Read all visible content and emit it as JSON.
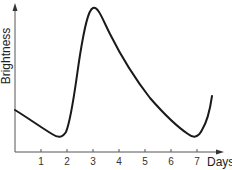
{
  "chart_data": {
    "type": "line",
    "title": "",
    "xlabel": "Days",
    "ylabel": "Brightness",
    "x_ticks": [
      "1",
      "2",
      "3",
      "4",
      "5",
      "6",
      "7"
    ],
    "xlim": [
      0,
      7.6
    ],
    "y_ticks": [],
    "grid": false,
    "legend": null,
    "series": [
      {
        "name": "Brightness",
        "x": [
          0.0,
          0.6,
          1.2,
          1.55,
          1.9,
          2.3,
          2.7,
          2.95,
          3.2,
          3.6,
          4.2,
          5.0,
          5.7,
          6.3,
          6.75,
          7.0,
          7.25
        ],
        "y": [
          0.22,
          0.15,
          0.09,
          0.08,
          0.22,
          0.7,
          0.96,
          0.98,
          0.9,
          0.72,
          0.53,
          0.33,
          0.2,
          0.12,
          0.08,
          0.13,
          0.3
        ]
      }
    ],
    "color": "#1a1a1a"
  },
  "labels": {
    "xlabel": "Days",
    "ylabel": "Brightness",
    "ticks": [
      "1",
      "2",
      "3",
      "4",
      "5",
      "6",
      "7"
    ]
  }
}
